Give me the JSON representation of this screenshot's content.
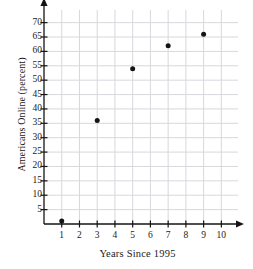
{
  "chart_data": {
    "type": "scatter",
    "title": "",
    "xlabel": "Years Since 1995",
    "ylabel": "Americans Online (percent)",
    "x": [
      1,
      3,
      5,
      7,
      9
    ],
    "values": [
      1,
      36,
      54,
      62,
      66
    ],
    "points": [
      {
        "x": 1,
        "y": 1
      },
      {
        "x": 3,
        "y": 36
      },
      {
        "x": 5,
        "y": 54
      },
      {
        "x": 7,
        "y": 62
      },
      {
        "x": 9,
        "y": 66
      }
    ],
    "xlim": [
      0,
      10.6
    ],
    "ylim": [
      0,
      73
    ],
    "xticks": [
      1,
      2,
      3,
      4,
      5,
      6,
      7,
      8,
      9,
      10
    ],
    "xtick_labels": [
      "1",
      "2",
      "3",
      "4",
      "5",
      "6",
      "7",
      "8",
      "9",
      "10"
    ],
    "yticks": [
      5,
      10,
      15,
      20,
      25,
      30,
      35,
      40,
      45,
      50,
      55,
      60,
      65,
      70
    ],
    "ytick_labels": [
      "5",
      "10",
      "15",
      "20",
      "25",
      "30",
      "35",
      "40",
      "45",
      "50",
      "55",
      "60",
      "65",
      "70"
    ],
    "grid": true,
    "legend": null,
    "marker": "filled-circle",
    "colors": {
      "marker": "#141414",
      "axis": "#141414",
      "grid": "#d8d8dd",
      "background": "#ffffff",
      "text": "#1a1a1a"
    },
    "axis_arrows": {
      "x": "right",
      "y": "up"
    }
  }
}
